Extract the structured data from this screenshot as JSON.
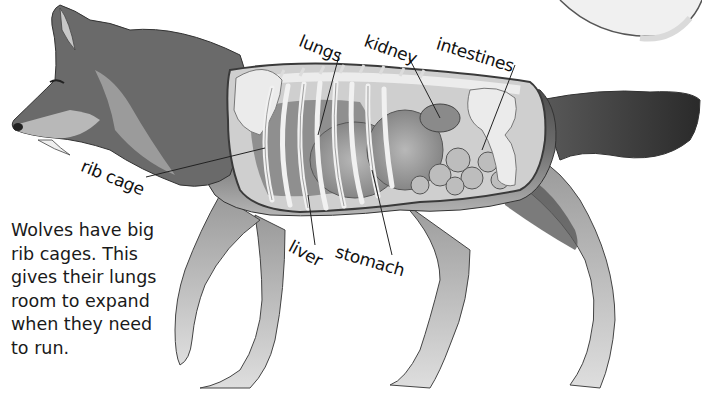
{
  "diagram": {
    "labels": [
      {
        "id": "lungs",
        "text": "lungs"
      },
      {
        "id": "kidney",
        "text": "kidney"
      },
      {
        "id": "intestines",
        "text": "intestines"
      },
      {
        "id": "rib-cage",
        "text": "rib cage"
      },
      {
        "id": "liver",
        "text": "liver"
      },
      {
        "id": "stomach",
        "text": "stomach"
      }
    ],
    "caption_lines": [
      "Wolves have big",
      "rib cages. This",
      "gives their lungs",
      "room to expand",
      "when they need",
      "to run."
    ]
  },
  "colors": {
    "background": "#ffffff",
    "fur_dark": "#4a4a4a",
    "fur_mid": "#8a8a8a",
    "fur_light": "#c9c9c9",
    "bone": "#e8e8e8",
    "organ": "#9a9a9a",
    "outline": "#333333",
    "leader_line": "#222222"
  }
}
